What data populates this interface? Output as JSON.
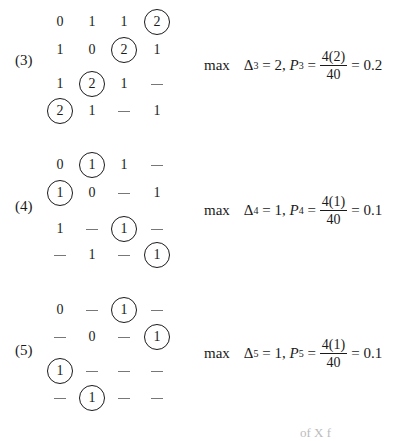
{
  "blocks": [
    {
      "label": "(3)",
      "matrix": [
        [
          {
            "v": "0"
          },
          {
            "v": "1"
          },
          {
            "v": "1"
          },
          {
            "v": "2",
            "c": true
          }
        ],
        [
          {
            "v": "1"
          },
          {
            "v": "0"
          },
          {
            "v": "2",
            "c": true
          },
          {
            "v": "1"
          }
        ],
        [
          {
            "v": "1"
          },
          {
            "v": "2",
            "c": true
          },
          {
            "v": "1"
          },
          {
            "v": "—"
          }
        ],
        [
          {
            "v": "2",
            "c": true
          },
          {
            "v": "1"
          },
          {
            "v": "—"
          },
          {
            "v": "1"
          }
        ]
      ],
      "formula": {
        "max": "max",
        "delta": "Δ",
        "sub": "3",
        "delta_val": "= 2,",
        "p": "P",
        "p_sub": "3",
        "eq": "=",
        "num": "4(2)",
        "den": "40",
        "result": "= 0.2"
      }
    },
    {
      "label": "(4)",
      "matrix": [
        [
          {
            "v": "0"
          },
          {
            "v": "1",
            "c": true
          },
          {
            "v": "1"
          },
          {
            "v": "—"
          }
        ],
        [
          {
            "v": "1",
            "c": true
          },
          {
            "v": "0"
          },
          {
            "v": "—"
          },
          {
            "v": "1"
          }
        ],
        [
          {
            "v": "1"
          },
          {
            "v": "—"
          },
          {
            "v": "1",
            "c": true
          },
          {
            "v": "—"
          }
        ],
        [
          {
            "v": "—"
          },
          {
            "v": "1"
          },
          {
            "v": "—"
          },
          {
            "v": "1",
            "c": true
          }
        ]
      ],
      "formula": {
        "max": "max",
        "delta": "Δ",
        "sub": "4",
        "delta_val": "= 1,",
        "p": "P",
        "p_sub": "4",
        "eq": "=",
        "num": "4(1)",
        "den": "40",
        "result": "= 0.1"
      }
    },
    {
      "label": "(5)",
      "matrix": [
        [
          {
            "v": "0"
          },
          {
            "v": "—"
          },
          {
            "v": "1",
            "c": true
          },
          {
            "v": "—"
          }
        ],
        [
          {
            "v": "—"
          },
          {
            "v": "0"
          },
          {
            "v": "—"
          },
          {
            "v": "1",
            "c": true
          }
        ],
        [
          {
            "v": "1",
            "c": true
          },
          {
            "v": "—"
          },
          {
            "v": "—"
          },
          {
            "v": "—"
          }
        ],
        [
          {
            "v": "—"
          },
          {
            "v": "1",
            "c": true
          },
          {
            "v": "—"
          },
          {
            "v": "—"
          }
        ]
      ],
      "formula": {
        "max": "max",
        "delta": "Δ",
        "sub": "5",
        "delta_val": "= 1,",
        "p": "P",
        "p_sub": "5",
        "eq": "=",
        "num": "4(1)",
        "den": "40",
        "result": "= 0.1"
      }
    }
  ],
  "cutoff_text": "of X f"
}
